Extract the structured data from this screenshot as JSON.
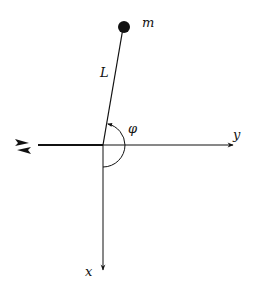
{
  "diagram": {
    "labels": {
      "mass": "m",
      "length": "L",
      "angle": "φ",
      "y_axis": "y",
      "x_axis": "x"
    },
    "colors": {
      "stroke": "#111111",
      "background": "#ffffff"
    },
    "geometry": {
      "origin": [
        103,
        145
      ],
      "mass_center": [
        123,
        28
      ],
      "mass_radius": 6,
      "y_axis_start": [
        38,
        145
      ],
      "y_axis_end": [
        233,
        145
      ],
      "x_axis_end": [
        103,
        270
      ],
      "angle_arc_radius": 22
    },
    "icons": {
      "support_motion": "double-arrow-left-right-icon"
    }
  }
}
